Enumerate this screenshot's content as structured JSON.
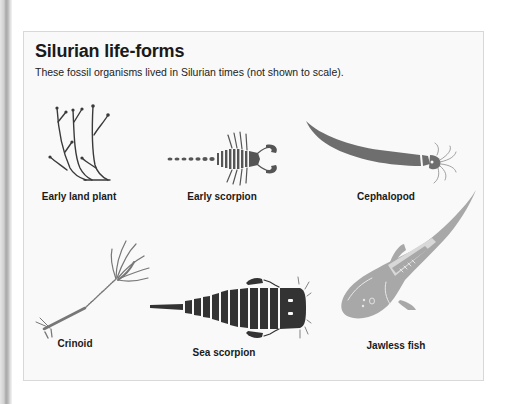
{
  "figure": {
    "title": "Silurian life-forms",
    "subtitle": "These fossil organisms lived in Silurian times (not shown to scale).",
    "organisms": [
      {
        "label": "Early land plant",
        "icon": "early-land-plant-icon",
        "color": "#3a3a3a"
      },
      {
        "label": "Early scorpion",
        "icon": "early-scorpion-icon",
        "color": "#555555"
      },
      {
        "label": "Cephalopod",
        "icon": "cephalopod-icon",
        "color": "#6e6e6e"
      },
      {
        "label": "Crinoid",
        "icon": "crinoid-icon",
        "color": "#777777"
      },
      {
        "label": "Sea scorpion",
        "icon": "sea-scorpion-icon",
        "color": "#333333"
      },
      {
        "label": "Jawless fish",
        "icon": "jawless-fish-icon",
        "color": "#a8a8a8"
      }
    ]
  }
}
